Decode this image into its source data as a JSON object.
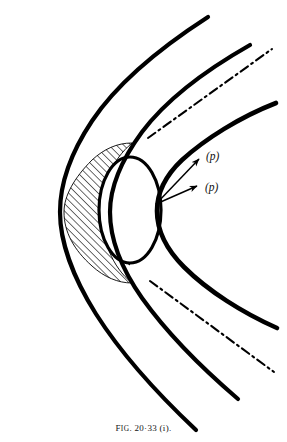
{
  "figure": {
    "id": "fig-20-33-i",
    "caption_prefix": "F",
    "caption_ig": "IG",
    "caption_rest": ". 20·33 (i).",
    "caption_full": "FIG. 20·33 (i).",
    "background_color": "#ffffff",
    "ink_color": "#000000",
    "labels": [
      {
        "id": "p-upper",
        "text": "(p)",
        "x": 206,
        "y": 160
      },
      {
        "id": "p-lower",
        "text": "(p)",
        "x": 205,
        "y": 191
      }
    ],
    "body_circle": {
      "name": "blunt-body-circle",
      "cx": 130,
      "cy": 210,
      "rx": 31,
      "ry": 53,
      "stroke_width": 3.2
    },
    "shock_curves": [
      {
        "id": "shock-outer",
        "name": "outer-shock-curve",
        "stroke_width": 4.2,
        "path": "M 208 17 C 160 48 118 82 92 121 C 70 154 60 186 60 212 C 60 240 72 276 96 314 C 124 358 162 398 196 430"
      },
      {
        "id": "shock-middle",
        "name": "middle-shock-curve",
        "stroke_width": 4.2,
        "path": "M 250 45 C 206 70 166 100 142 132 C 120 162 110 189 110 212 C 110 238 121 268 142 298 C 167 333 203 369 238 399"
      },
      {
        "id": "shock-inner",
        "name": "inner-shock-curve",
        "stroke_width": 4.6,
        "path": "M 276 103 C 240 117 205 139 182 160 C 165 176 157 194 157 211 C 157 230 166 249 184 267 C 208 291 243 313 277 328"
      }
    ],
    "hatched_regions": [
      {
        "id": "hatch-outer-crescent",
        "name": "outer-hatched-shock-layer",
        "path": "M 92 160 C 74 178 64 196 64 212 C 64 232 74 250 92 266 C 104 277 118 283 132 283 C 112 267 102 240 102 212 C 102 184 112 160 132 143 C 117 143 104 149 92 160 Z"
      },
      {
        "id": "hatch-inner-crescent",
        "name": "inner-hatched-shock-layer",
        "path": "M 130 157 C 113 172 104 190 104 212 C 104 234 113 252 130 265 C 112 252 102 233 102 212 C 102 190 113 171 130 157 Z"
      }
    ],
    "asymptotes": [
      {
        "id": "asymptote-upper",
        "name": "upper-asymptote-dash-dot",
        "path": "M 148 138 L 272 49",
        "dash": "9,4,2,4"
      },
      {
        "id": "asymptote-lower",
        "name": "lower-asymptote-dash-dot",
        "path": "M 150 281 L 274 372",
        "dash": "9,4,2,4"
      }
    ],
    "arrows": [
      {
        "id": "arrow-upper-p",
        "name": "pressure-arrow-upper",
        "from_x": 156,
        "from_y": 204,
        "to_x": 199,
        "to_y": 159
      },
      {
        "id": "arrow-lower-p",
        "name": "pressure-arrow-lower",
        "from_x": 156,
        "from_y": 204,
        "to_x": 197,
        "to_y": 186
      }
    ]
  }
}
